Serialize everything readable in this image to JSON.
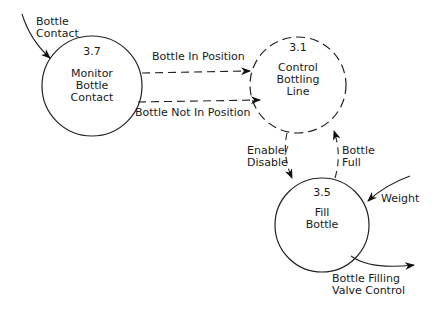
{
  "diagram": {
    "type": "data-flow",
    "processes": [
      {
        "id": "3.7",
        "number": "3.7",
        "line1": "Monitor",
        "line2": "Bottle",
        "line3": "Contact",
        "border": "solid"
      },
      {
        "id": "3.1",
        "number": "3.1",
        "line1": "Control",
        "line2": "Bottling",
        "line3": "Line",
        "border": "dashed"
      },
      {
        "id": "3.5",
        "number": "3.5",
        "line1": "Fill",
        "line2": "Bottle",
        "border": "solid"
      }
    ],
    "flows": [
      {
        "line1": "Bottle",
        "line2": "Contact",
        "from": "external",
        "to": "3.7",
        "style": "solid"
      },
      {
        "label": "Bottle In Position",
        "from": "3.7",
        "to": "3.1",
        "style": "dashed"
      },
      {
        "label": "Bottle Not In Position",
        "from": "3.7",
        "to": "3.1",
        "style": "dashed"
      },
      {
        "line1": "Enable/",
        "line2": "Disable",
        "from": "3.1",
        "to": "3.5",
        "style": "dashed"
      },
      {
        "line1": "Bottle",
        "line2": "Full",
        "from": "3.5",
        "to": "3.1",
        "style": "dashed"
      },
      {
        "label": "Weight",
        "from": "external",
        "to": "3.5",
        "style": "solid"
      },
      {
        "line1": "Bottle Filling",
        "line2": "Valve Control",
        "from": "3.5",
        "to": "external",
        "style": "solid"
      }
    ]
  }
}
